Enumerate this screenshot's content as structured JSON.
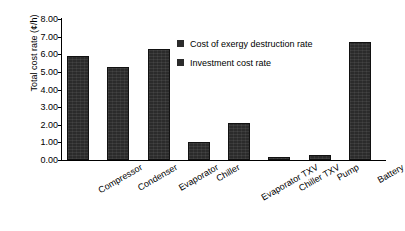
{
  "chart_data": {
    "type": "bar",
    "title": "",
    "xlabel": "",
    "ylabel": "Total cost rate (¢/h)",
    "categories": [
      "Compressor",
      "Condenser",
      "Evaporator",
      "Chiller",
      "Evaporator TXV",
      "Chiller TXV",
      "Pump",
      "Battery"
    ],
    "values": [
      5.9,
      5.3,
      6.3,
      1.0,
      2.1,
      0.15,
      0.3,
      6.7
    ],
    "series": [
      {
        "name": "Cost of exergy destruction rate",
        "values": [
          5.9,
          5.3,
          6.3,
          1.0,
          2.1,
          0.15,
          0.3,
          6.7
        ]
      }
    ],
    "ylim": [
      0.0,
      8.0
    ],
    "ytick_step": 1.0,
    "ytick_labels": [
      "8.00",
      "7.00",
      "6.00",
      "5.00",
      "4.00",
      "3.00",
      "2.00",
      "1.00",
      "0.00"
    ],
    "ytick_values": [
      8.0,
      7.0,
      6.0,
      5.0,
      4.0,
      3.0,
      2.0,
      1.0,
      0.0
    ],
    "grid": false,
    "legend_position": "upper-right-inside",
    "legend": [
      {
        "label": "Cost of exergy destruction rate",
        "color": "#2b2b2b"
      },
      {
        "label": "Investment cost rate",
        "color": "#2b2b2b"
      }
    ],
    "bar_color": "#2b2b2b",
    "axis_color": "#000000",
    "background_color": "#ffffff"
  }
}
